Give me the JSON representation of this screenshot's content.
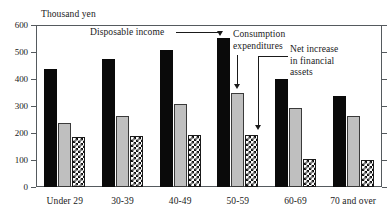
{
  "chart_data": {
    "type": "bar",
    "title": "",
    "subtitle": "",
    "unit_label": "Thousand yen",
    "xlabel": "",
    "ylabel": "",
    "ylim": [
      0,
      600
    ],
    "ytick_values": [
      600,
      500,
      400,
      300,
      200,
      100,
      0
    ],
    "ytick_labels": [
      "600",
      "500",
      "400",
      "300",
      "200",
      "100",
      "0"
    ],
    "grid": false,
    "legend_position": "none",
    "categories": [
      "Under 29",
      "30-39",
      "40-49",
      "50-59",
      "60-69",
      "70 and over"
    ],
    "series": [
      {
        "name": "Disposable income",
        "fill": "solid-black",
        "color": "#0a0a0a",
        "values": [
          437,
          474,
          507,
          551,
          400,
          337
        ]
      },
      {
        "name": "Consumption expenditures",
        "fill": "solid-gray",
        "color": "#bfbfbf",
        "values": [
          237,
          263,
          307,
          348,
          293,
          263
        ]
      },
      {
        "name": "Net increase in financial assets",
        "fill": "checkerboard",
        "color": "#111111",
        "values": [
          185,
          189,
          193,
          193,
          104,
          100
        ]
      }
    ],
    "annotations": [
      {
        "id": "disposable-income",
        "text": "Disposable income",
        "points_to": "series-0 bar of 50-59"
      },
      {
        "id": "consumption-expenditures",
        "text": "Consumption\nexpenditures",
        "points_to": "series-1 bar of 50-59"
      },
      {
        "id": "net-increase-financial-assets",
        "text": "Net increase\nin financial\nassets",
        "points_to": "series-2 bar of 50-59"
      }
    ]
  },
  "colors": {
    "axis": "#555a5e",
    "text": "#1a1a1a",
    "background": "#ffffff"
  }
}
